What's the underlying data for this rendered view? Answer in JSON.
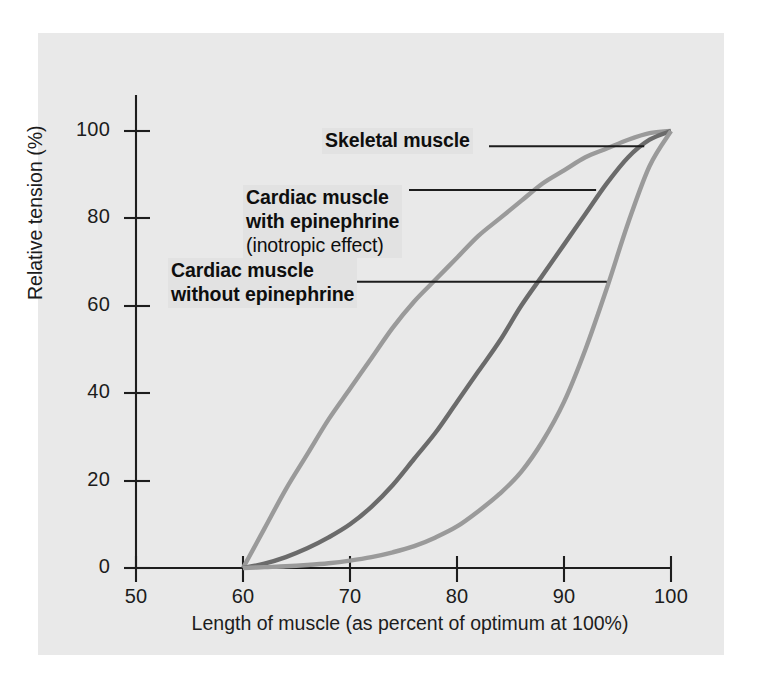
{
  "figure": {
    "background_color": "#e9e9e9",
    "page_color": "#ffffff"
  },
  "chart_data": {
    "type": "line",
    "title": "",
    "xlabel": "Length of muscle (as percent of optimum at 100%)",
    "ylabel": "Relative tension (%)",
    "xlim": [
      50,
      100
    ],
    "ylim": [
      0,
      100
    ],
    "xticks": [
      50,
      60,
      70,
      80,
      90,
      100
    ],
    "yticks": [
      0,
      20,
      40,
      60,
      80,
      100
    ],
    "xtick_labels": [
      "50",
      "60",
      "70",
      "80",
      "90",
      "100"
    ],
    "ytick_labels": [
      "0",
      "20",
      "40",
      "60",
      "80",
      "100"
    ],
    "grid": false,
    "legend_position": "inline-annotations",
    "series": [
      {
        "name": "Skeletal muscle",
        "color": "#9a9a9a",
        "x": [
          60,
          62,
          64,
          66,
          68,
          70,
          72,
          74,
          76,
          78,
          80,
          82,
          84,
          86,
          88,
          90,
          92,
          94,
          96,
          98,
          100
        ],
        "values": [
          0,
          9,
          18,
          26,
          34,
          41,
          48,
          55,
          61,
          66,
          71,
          76,
          80,
          84,
          88,
          91,
          94,
          96,
          98,
          99.5,
          100
        ]
      },
      {
        "name": "Cardiac muscle with epinephrine",
        "color": "#6b6b6b",
        "x": [
          60,
          62,
          64,
          66,
          68,
          70,
          72,
          74,
          76,
          78,
          80,
          82,
          84,
          86,
          88,
          90,
          92,
          94,
          96,
          98,
          100
        ],
        "values": [
          0,
          1,
          2.5,
          4.5,
          7,
          10,
          14,
          19,
          25,
          31,
          38,
          45,
          52,
          60,
          67,
          74,
          81,
          88,
          94,
          98,
          100
        ]
      },
      {
        "name": "Cardiac muscle without epinephrine",
        "color": "#9a9a9a",
        "x": [
          60,
          62,
          64,
          66,
          68,
          70,
          72,
          74,
          76,
          78,
          80,
          82,
          84,
          86,
          88,
          90,
          92,
          94,
          96,
          98,
          100
        ],
        "values": [
          0,
          0.2,
          0.4,
          0.7,
          1.1,
          1.7,
          2.5,
          3.6,
          5,
          7,
          9.5,
          13,
          17,
          22,
          29,
          38,
          50,
          64,
          79,
          92,
          100
        ]
      }
    ],
    "annotations": [
      {
        "id": "skeletal",
        "lines": [
          "Skeletal muscle"
        ],
        "sub_line": "",
        "leader": {
          "x1": 60,
          "y1": 96.5,
          "x2": 97.5,
          "y2": 96.5
        }
      },
      {
        "id": "with_epinephrine",
        "lines": [
          "Cardiac muscle",
          "with epinephrine"
        ],
        "sub_line": "(inotropic effect)",
        "leader": {
          "x1": 60,
          "y1": 86.5,
          "x2": 93,
          "y2": 86.5
        }
      },
      {
        "id": "without_epinephrine",
        "lines": [
          "Cardiac muscle",
          "without epinephrine"
        ],
        "sub_line": "",
        "leader": {
          "x1": 60,
          "y1": 65.5,
          "x2": 94,
          "y2": 65.5
        }
      }
    ]
  },
  "axis": {
    "y": {
      "t100": "100",
      "t80": "80",
      "t60": "60",
      "t40": "40",
      "t20": "20",
      "t0": "0",
      "label": "Relative tension (%)"
    },
    "x": {
      "t50": "50",
      "t60": "60",
      "t70": "70",
      "t80": "80",
      "t90": "90",
      "t100": "100",
      "label": "Length of muscle (as percent of optimum at 100%)"
    }
  },
  "annotations": {
    "skeletal": {
      "line1": "Skeletal muscle"
    },
    "with_epinephrine": {
      "line1": "Cardiac muscle",
      "line2": "with epinephrine",
      "line3": "(inotropic effect)"
    },
    "without_epinephrine": {
      "line1": "Cardiac muscle",
      "line2": "without epinephrine"
    }
  }
}
